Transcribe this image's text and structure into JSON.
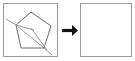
{
  "figure": {
    "title": "Pentagon with crossing chords transforms to empty square",
    "type": "transformation-diagram",
    "background_color": "#ffffff",
    "panel_border_color": "#9a9a9a",
    "stroke_color": "#6b6b6b",
    "arrow_color": "#111111",
    "panels": [
      {
        "name": "source-panel",
        "label": "",
        "x": 3,
        "y": 3,
        "width": 55,
        "height": 54,
        "contents": "pentagon-with-chords"
      },
      {
        "name": "result-panel",
        "label": "",
        "x": 80,
        "y": 3,
        "width": 52,
        "height": 54,
        "contents": "empty"
      }
    ],
    "arrow": {
      "name": "transform-arrow",
      "glyph": "right-arrow",
      "x": 62,
      "y": 30,
      "length": 14
    },
    "shape": {
      "name": "pentagon",
      "sides": 5,
      "vertices": [
        [
          31,
          12
        ],
        [
          51,
          26
        ],
        [
          44,
          48
        ],
        [
          21,
          48
        ],
        [
          16,
          25
        ]
      ],
      "chords": [
        {
          "name": "chord-a",
          "from": [
            16,
            25
          ],
          "to": [
            44,
            48
          ]
        },
        {
          "name": "chord-b",
          "from": [
            31,
            28
          ],
          "to": [
            47,
            50
          ]
        },
        {
          "name": "chord-c",
          "from": [
            16,
            25
          ],
          "to": [
            34,
            30
          ]
        }
      ],
      "tails": [
        {
          "name": "tail-upper-left",
          "from": [
            16,
            25
          ],
          "to": [
            6,
            19
          ]
        },
        {
          "name": "tail-lower-right",
          "from": [
            44,
            48
          ],
          "to": [
            52,
            55
          ]
        }
      ]
    }
  }
}
